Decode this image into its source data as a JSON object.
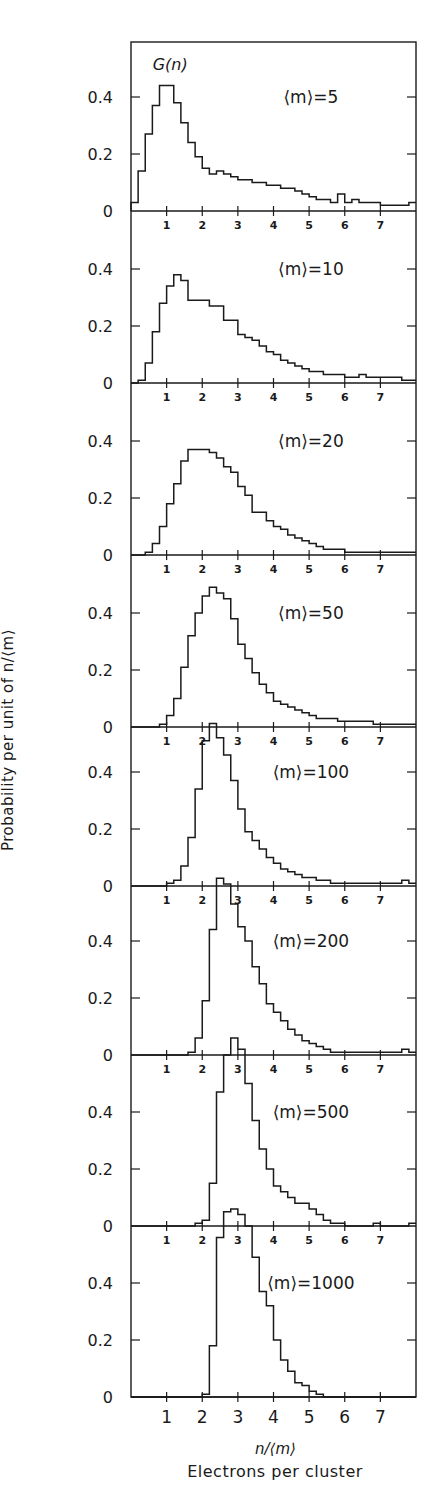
{
  "chart_data": {
    "type": "step-histogram (stacked panels)",
    "title": "",
    "xlabel": "n/⟨m⟩",
    "xlabel_secondary": "Electrons per cluster",
    "ylabel": "Probability per unit of n/⟨m⟩",
    "curve_label": "G(n)",
    "xlim": [
      0,
      8
    ],
    "x_ticks": [
      1,
      2,
      3,
      4,
      5,
      6,
      7
    ],
    "y_ticks": [
      0,
      0.2,
      0.4
    ],
    "bin_width": 0.2,
    "grid": false,
    "panels": [
      {
        "label": "⟨m⟩=5",
        "mean_m": 5,
        "bin_start": 0.0,
        "values": [
          0.03,
          0.14,
          0.27,
          0.37,
          0.44,
          0.44,
          0.38,
          0.31,
          0.24,
          0.19,
          0.15,
          0.13,
          0.14,
          0.13,
          0.12,
          0.11,
          0.11,
          0.1,
          0.1,
          0.09,
          0.09,
          0.08,
          0.08,
          0.07,
          0.06,
          0.05,
          0.04,
          0.04,
          0.03,
          0.06,
          0.03,
          0.04,
          0.03,
          0.03,
          0.03,
          0.02,
          0.02,
          0.02,
          0.02,
          0.03
        ]
      },
      {
        "label": "⟨m⟩=10",
        "mean_m": 10,
        "bin_start": 0.0,
        "values": [
          0.0,
          0.01,
          0.07,
          0.18,
          0.28,
          0.34,
          0.38,
          0.36,
          0.29,
          0.29,
          0.29,
          0.27,
          0.27,
          0.22,
          0.22,
          0.17,
          0.16,
          0.15,
          0.13,
          0.11,
          0.1,
          0.08,
          0.07,
          0.06,
          0.05,
          0.04,
          0.04,
          0.03,
          0.03,
          0.03,
          0.02,
          0.02,
          0.03,
          0.02,
          0.02,
          0.02,
          0.02,
          0.02,
          0.01,
          0.01
        ]
      },
      {
        "label": "⟨m⟩=20",
        "mean_m": 20,
        "bin_start": 0.0,
        "values": [
          0.0,
          0.0,
          0.01,
          0.04,
          0.1,
          0.18,
          0.25,
          0.33,
          0.37,
          0.37,
          0.37,
          0.36,
          0.34,
          0.31,
          0.29,
          0.24,
          0.21,
          0.15,
          0.15,
          0.12,
          0.1,
          0.09,
          0.07,
          0.06,
          0.05,
          0.04,
          0.03,
          0.02,
          0.02,
          0.02,
          0.01,
          0.01,
          0.01,
          0.01,
          0.01,
          0.01,
          0.01,
          0.01,
          0.01,
          0.01
        ]
      },
      {
        "label": "⟨m⟩=50",
        "mean_m": 50,
        "bin_start": 0.0,
        "values": [
          0,
          0,
          0,
          0,
          0.01,
          0.04,
          0.1,
          0.21,
          0.32,
          0.4,
          0.46,
          0.49,
          0.47,
          0.45,
          0.38,
          0.29,
          0.24,
          0.19,
          0.15,
          0.12,
          0.09,
          0.08,
          0.07,
          0.06,
          0.05,
          0.04,
          0.03,
          0.03,
          0.03,
          0.02,
          0.02,
          0.02,
          0.02,
          0.02,
          0.01,
          0.01,
          0.01,
          0.01,
          0.01,
          0.01
        ]
      },
      {
        "label": "⟨m⟩=100",
        "mean_m": 100,
        "bin_start": 0.0,
        "values": [
          0,
          0,
          0,
          0,
          0,
          0.01,
          0.02,
          0.07,
          0.17,
          0.34,
          0.51,
          0.57,
          0.52,
          0.46,
          0.37,
          0.27,
          0.19,
          0.16,
          0.13,
          0.1,
          0.08,
          0.06,
          0.05,
          0.04,
          0.03,
          0.03,
          0.02,
          0.02,
          0.01,
          0.01,
          0.01,
          0.01,
          0.01,
          0.01,
          0.01,
          0.01,
          0.01,
          0.01,
          0.02,
          0.01
        ]
      },
      {
        "label": "⟨m⟩=200",
        "mean_m": 200,
        "bin_start": 0.0,
        "values": [
          0,
          0,
          0,
          0,
          0,
          0,
          0,
          0,
          0.01,
          0.06,
          0.19,
          0.44,
          0.62,
          0.6,
          0.53,
          0.45,
          0.4,
          0.31,
          0.25,
          0.18,
          0.15,
          0.12,
          0.09,
          0.07,
          0.05,
          0.04,
          0.03,
          0.02,
          0.01,
          0.01,
          0.01,
          0.01,
          0.01,
          0.01,
          0.01,
          0.01,
          0.01,
          0.01,
          0.02,
          0.01
        ]
      },
      {
        "label": "⟨m⟩=500",
        "mean_m": 500,
        "bin_start": 0.0,
        "values": [
          0,
          0,
          0,
          0,
          0,
          0,
          0,
          0,
          0,
          0.01,
          0.02,
          0.15,
          0.47,
          0.6,
          0.66,
          0.62,
          0.5,
          0.37,
          0.27,
          0.2,
          0.14,
          0.12,
          0.1,
          0.08,
          0.08,
          0.06,
          0.04,
          0.02,
          0.01,
          0.01,
          0.0,
          0.0,
          0.0,
          0.0,
          0.01,
          0.0,
          0.0,
          0.0,
          0.0,
          0.01
        ]
      },
      {
        "label": "⟨m⟩=1000",
        "mean_m": 1000,
        "bin_start": 0.0,
        "values": [
          0,
          0,
          0,
          0,
          0,
          0,
          0,
          0,
          0,
          0,
          0.01,
          0.18,
          0.56,
          0.65,
          0.66,
          0.64,
          0.6,
          0.49,
          0.37,
          0.32,
          0.2,
          0.13,
          0.09,
          0.05,
          0.04,
          0.02,
          0.01,
          0.0,
          0.0,
          0.0,
          0.0,
          0.0,
          0.0,
          0.0,
          0.0,
          0.0,
          0.0,
          0.0,
          0.0,
          0.0
        ]
      }
    ]
  },
  "axis": {
    "y_tick_labels": [
      "0",
      "0.2",
      "0.4"
    ],
    "x_tick_labels": [
      "1",
      "2",
      "3",
      "4",
      "5",
      "6",
      "7"
    ]
  },
  "labels": {
    "curve": "G(n)",
    "ylabel": "Probability per unit of n/⟨m⟩",
    "xlabel": "n/⟨m⟩",
    "xlabel_secondary": "Electrons per cluster"
  },
  "colors": {
    "ink": "#1a1a1a",
    "background": "#ffffff"
  }
}
